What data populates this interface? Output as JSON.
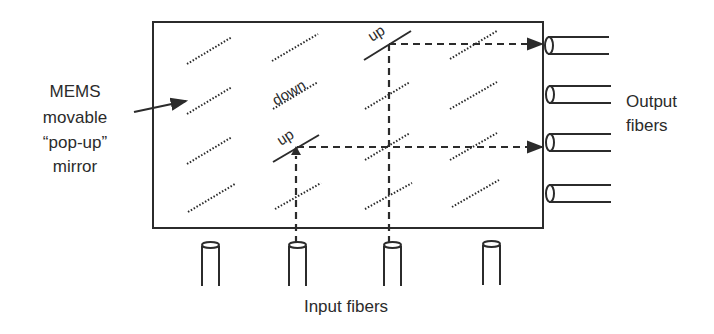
{
  "diagram": {
    "labels": {
      "mems_line1": "MEMS",
      "mems_line2": "movable",
      "mems_line3": "“pop-up”",
      "mems_line4": "mirror",
      "output_line1": "Output",
      "output_line2": "fibers",
      "input": "Input fibers",
      "down": "down",
      "up1": "up",
      "up2": "up"
    },
    "grid": {
      "rows": 4,
      "cols": 4
    },
    "mirror_states": [
      [
        "down",
        "down",
        "up",
        "down"
      ],
      [
        "down",
        "down",
        "down",
        "down"
      ],
      [
        "down",
        "up",
        "down",
        "down"
      ],
      [
        "down",
        "down",
        "down",
        "down"
      ]
    ],
    "input_fibers": 4,
    "output_fibers": 4,
    "light_paths": [
      {
        "from": "input-3",
        "via": "mirror r1c3 (up)",
        "to": "output-1"
      },
      {
        "from": "input-2",
        "via": "mirror r3c2 (up)",
        "to": "output-3"
      }
    ],
    "colors": {
      "line": "#2b2b2b",
      "background": "#ffffff"
    }
  }
}
